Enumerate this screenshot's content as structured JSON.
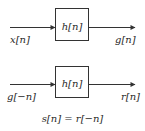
{
  "diagram": {
    "top_system": {
      "input_label": "x[n]",
      "block_label": "h[n]",
      "output_label": "g[n]"
    },
    "bottom_system": {
      "input_label": "g[−n]",
      "block_label": "h[n]",
      "output_label": "r[n]"
    },
    "equation": "s[n] = r[−n]",
    "colors": {
      "stroke": "#333333",
      "background": "#ffffff"
    }
  }
}
